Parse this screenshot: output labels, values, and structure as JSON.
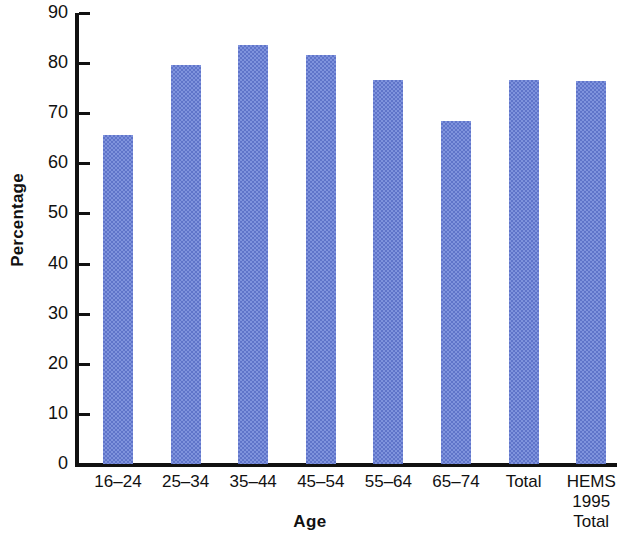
{
  "chart_data": {
    "type": "bar",
    "title": "",
    "xlabel": "Age",
    "ylabel": "Percentage",
    "categories": [
      "16–24",
      "25–34",
      "35–44",
      "45–54",
      "55–64",
      "65–74",
      "Total",
      "HEMS\n1995\nTotal"
    ],
    "values": [
      65.6,
      79.7,
      83.7,
      81.6,
      76.7,
      68.4,
      76.6,
      76.5
    ],
    "ylim": [
      0,
      90
    ],
    "yticks": [
      0,
      10,
      20,
      30,
      40,
      50,
      60,
      70,
      80,
      90
    ],
    "ytick_labels": [
      "0",
      "10",
      "20",
      "30",
      "40",
      "50",
      "60",
      "70",
      "80",
      "90"
    ],
    "grid": false,
    "legend": null,
    "bar_color": "#7f93dd",
    "bar_color_dark": "#5f74c9",
    "axis_color": "#111111"
  },
  "axes": {
    "y_title": "Percentage",
    "x_title": "Age"
  }
}
